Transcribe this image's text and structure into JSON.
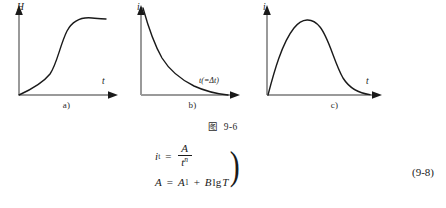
{
  "figure": {
    "caption_prefix": "图",
    "caption_number": "9-6",
    "panels": [
      {
        "id": "a",
        "caption": "a)",
        "y_axis_label": "H",
        "x_axis_label": "t",
        "curve_shape": "sigmoid-s-curve-rising-to-plateau"
      },
      {
        "id": "b",
        "caption": "b)",
        "y_axis_label": "i",
        "x_axis_label": "t(=Δt)",
        "curve_shape": "monotonic-decaying-power-law"
      },
      {
        "id": "c",
        "caption": "c)",
        "y_axis_label": "i",
        "x_axis_label": "t",
        "curve_shape": "unimodal-rise-and-fall-hump"
      }
    ]
  },
  "equations": {
    "line1": {
      "lhs_symbol": "i",
      "lhs_subscript": "t",
      "operator": "=",
      "numerator": "A",
      "denominator_base": "t",
      "denominator_exponent": "n"
    },
    "line2": {
      "lhs_symbol": "A",
      "operator": "=",
      "term1_symbol": "A",
      "term1_subscript": "1",
      "plus": "+",
      "term2_coefficient": "B",
      "term2_function": "lg",
      "term2_variable": "T"
    },
    "brace": ")",
    "number": "(9-8)"
  }
}
